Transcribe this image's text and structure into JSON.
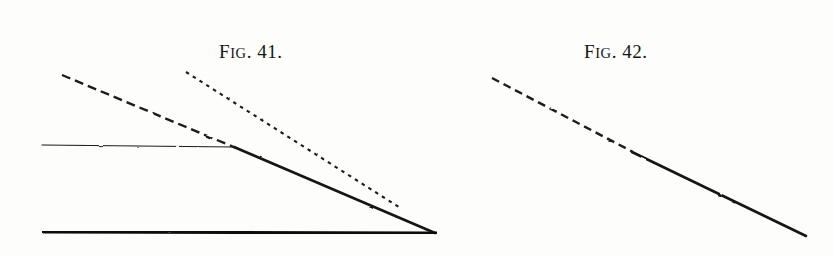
{
  "page": {
    "width": 834,
    "height": 256,
    "background": "#fdfdfc",
    "ink": "#161616",
    "kind": "book-plate-line-engraving"
  },
  "figures": [
    {
      "id": "fig-41",
      "caption_word": "F",
      "caption_small": "IG",
      "caption_rest": ". 41.",
      "caption_full": "FIG. 41.",
      "caption_x": 240,
      "caption_y": 33,
      "description": "Wedge-shaped block in side elevation with thick base, irregular left end, thin upper surface, a long tapering inclined face, and two dashed ray lines descending from upper left.",
      "geometry": {
        "top_left": [
          42,
          145
        ],
        "top_vertex": [
          234,
          147
        ],
        "tip": [
          435,
          233
        ],
        "bottom_left": [
          42,
          232
        ],
        "left_edge_top": [
          42,
          143
        ],
        "left_edge_bottom": [
          42,
          233
        ]
      },
      "dashed_lines": [
        {
          "name": "upper-ray-coarse",
          "start": [
            62,
            75
          ],
          "end": [
            236,
            148
          ],
          "pattern": "coarse",
          "dash": "9 5"
        },
        {
          "name": "lower-ray-fine",
          "start": [
            186,
            72
          ],
          "end": [
            402,
            209
          ],
          "pattern": "fine",
          "dash": "3.5 4.5"
        }
      ]
    },
    {
      "id": "fig-42",
      "caption_word": "F",
      "caption_small": "IG",
      "caption_rest": ". 42.",
      "caption_full": "FIG. 42.",
      "caption_x": 605,
      "caption_y": 33,
      "description": "Same wedge-shaped block in side elevation, with a single dashed ray descending from upper left that stops exactly at the top vertex of the inclined face.",
      "geometry": {
        "top_left": [
          477,
          152
        ],
        "top_vertex": [
          632,
          152
        ],
        "tip": [
          806,
          236
        ],
        "bottom_left": [
          477,
          237
        ],
        "left_edge_top": [
          477,
          150
        ],
        "left_edge_bottom": [
          477,
          238
        ]
      },
      "dashed_lines": [
        {
          "name": "upper-ray-coarse",
          "start": [
            492,
            78
          ],
          "end": [
            633,
            152
          ],
          "pattern": "coarse",
          "dash": "8 5"
        }
      ]
    }
  ],
  "strokes": {
    "base_width": 3.2,
    "top_width": 1.1,
    "incline_width": 2.6,
    "left_edge_width": 2.6,
    "dash_width": 2.4,
    "dot_width": 2.1
  }
}
